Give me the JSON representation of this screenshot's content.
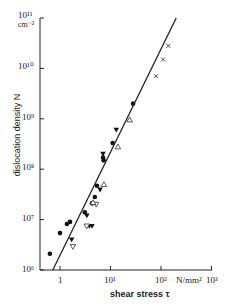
{
  "chart_data": {
    "type": "scatter",
    "title": "",
    "xlabel": "shear stress τ",
    "ylabel": "dislocation density N",
    "x_unit": "N/mm²",
    "y_unit": "cm⁻²",
    "xscale": "log",
    "yscale": "log",
    "xlim": [
      0.4,
      1000
    ],
    "ylim": [
      1000000,
      100000000000
    ],
    "x_ticks": [
      "1",
      "10¹",
      "10²",
      "10³"
    ],
    "y_ticks": [
      "10⁶",
      "10⁷",
      "10⁸",
      "10⁹",
      "10¹⁰",
      "10¹¹"
    ],
    "grid": false,
    "legend": "none",
    "series": [
      {
        "name": "filled circles",
        "marker": "circle-filled",
        "x": [
          0.63,
          1.0,
          1.37,
          1.58,
          3.1,
          4.3,
          4.9,
          5.4,
          7.1,
          7.3,
          11,
          28
        ],
        "y": [
          2100000.0,
          5400000.0,
          8200000.0,
          9000000.0,
          14000000.0,
          21000000.0,
          28000000.0,
          47000000.0,
          170000000.0,
          150000000.0,
          330000000.0,
          2000000000.0
        ]
      },
      {
        "name": "filled triangles",
        "marker": "triangle-down-filled",
        "x": [
          1.7,
          3.4,
          3.8,
          4.3,
          6.2,
          7.1,
          13
        ],
        "y": [
          4000000.0,
          12000000.0,
          7400000.0,
          7400000.0,
          39000000.0,
          200000000.0,
          600000000.0
        ]
      },
      {
        "name": "open inverted triangles",
        "marker": "triangle-down-open",
        "x": [
          1.8,
          3.4,
          5.2
        ],
        "y": [
          2900000.0,
          7400000.0,
          20000000.0
        ]
      },
      {
        "name": "open triangles",
        "marker": "triangle-up-open",
        "x": [
          4.5,
          7.4,
          14,
          24
        ],
        "y": [
          22000000.0,
          50000000.0,
          280000000.0,
          960000000.0
        ]
      },
      {
        "name": "crosses",
        "marker": "x",
        "x": [
          80,
          110,
          140
        ],
        "y": [
          7000000000.0,
          15000000000.0,
          28000000000.0
        ]
      },
      {
        "name": "fit line",
        "marker": "line",
        "x": [
          0.72,
          200
        ],
        "y": [
          1000000.0,
          100000000000.0
        ]
      }
    ]
  },
  "labels": {
    "y_unit_top": "10¹¹",
    "y_unit_cm": "cm⁻²",
    "y_tick_10": "10¹⁰",
    "y_tick_9": "10⁹",
    "y_tick_8": "10⁸",
    "y_tick_7": "10⁷",
    "y_tick_6": "10⁶",
    "x_tick_0": "1",
    "x_tick_1": "10¹",
    "x_tick_2": "10²",
    "x_unit": "N/mm²",
    "x_tick_3": "10³",
    "ylabel": "dislocation density N",
    "xlabel": "shear stress τ"
  }
}
